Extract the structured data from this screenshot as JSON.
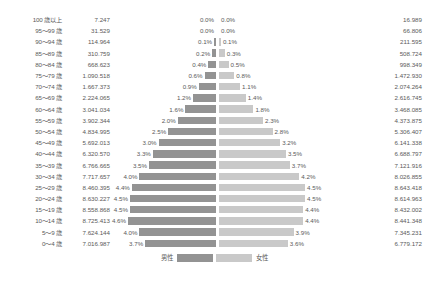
{
  "legend": {
    "male_label": "男性",
    "female_label": "女性",
    "male_color": "#939393",
    "female_color": "#c9c9c9"
  },
  "chart_data": {
    "type": "bar",
    "subtype": "population-pyramid",
    "title": "",
    "xlabel": "",
    "ylabel": "",
    "grid": false,
    "legend_position": "bottom-center",
    "max_pct": 4.6,
    "categories": [
      "100 歳以上",
      "95～99 歳",
      "90～94 歳",
      "85～89 歳",
      "80～84 歳",
      "75～79 歳",
      "70～74 歳",
      "65～69 歳",
      "60～64 歳",
      "55～59 歳",
      "50～54 歳",
      "45～49 歳",
      "40～44 歳",
      "35～39 歳",
      "30～34 歳",
      "25～29 歳",
      "20～24 歳",
      "15～19 歳",
      "10～14 歳",
      "5～9 歳",
      "0～4 歳"
    ],
    "series": [
      {
        "name": "男性",
        "color": "#939393",
        "side": "left",
        "values": [
          7247,
          31529,
          114964,
          310759,
          668623,
          1090518,
          1667373,
          2224065,
          3041034,
          3902344,
          4834995,
          5692013,
          6320570,
          6766665,
          7717657,
          8460395,
          8630227,
          8558868,
          8725413,
          7624144,
          7016987
        ],
        "value_labels": [
          "7.247",
          "31.529",
          "114.964",
          "310.759",
          "668.623",
          "1.090.518",
          "1.667.373",
          "2.224.065",
          "3.041.034",
          "3.902.344",
          "4.834.995",
          "5.692.013",
          "6.320.570",
          "6.766.665",
          "7.717.657",
          "8.460.395",
          "8.630.227",
          "8.558.868",
          "8.725.413",
          "7.624.144",
          "7.016.987"
        ],
        "percents": [
          0.0,
          0.0,
          0.1,
          0.2,
          0.4,
          0.6,
          0.9,
          1.2,
          1.6,
          2.0,
          2.5,
          3.0,
          3.3,
          3.5,
          4.0,
          4.4,
          4.5,
          4.5,
          4.6,
          4.0,
          3.7
        ],
        "percent_labels": [
          "0.0%",
          "0.0%",
          "0.1%",
          "0.2%",
          "0.4%",
          "0.6%",
          "0.9%",
          "1.2%",
          "1.6%",
          "2.0%",
          "2.5%",
          "3.0%",
          "3.3%",
          "3.5%",
          "4.0%",
          "4.4%",
          "4.5%",
          "4.5%",
          "4.6%",
          "4.0%",
          "3.7%"
        ]
      },
      {
        "name": "女性",
        "color": "#c9c9c9",
        "side": "right",
        "values": [
          16989,
          66806,
          211595,
          508724,
          998349,
          1472930,
          2074264,
          2616745,
          3468085,
          4373875,
          5306407,
          6141338,
          6688797,
          7121916,
          8026855,
          8643418,
          8614963,
          8432002,
          8441348,
          7345231,
          6779172
        ],
        "value_labels": [
          "16.989",
          "66.806",
          "211.595",
          "508.724",
          "998.349",
          "1.472.930",
          "2.074.264",
          "2.616.745",
          "3.468.085",
          "4.373.875",
          "5.306.407",
          "6.141.338",
          "6.688.797",
          "7.121.916",
          "8.026.855",
          "8.643.418",
          "8.614.963",
          "8.432.002",
          "8.441.348",
          "7.345.231",
          "6.779.172"
        ],
        "percents": [
          0.0,
          0.0,
          0.1,
          0.3,
          0.5,
          0.8,
          1.1,
          1.4,
          1.8,
          2.3,
          2.8,
          3.2,
          3.5,
          3.7,
          4.2,
          4.5,
          4.5,
          4.4,
          4.4,
          3.9,
          3.6
        ],
        "percent_labels": [
          "0.0%",
          "0.0%",
          "0.1%",
          "0.3%",
          "0.5%",
          "0.8%",
          "1.1%",
          "1.4%",
          "1.8%",
          "2.3%",
          "2.8%",
          "3.2%",
          "3.5%",
          "3.7%",
          "4.2%",
          "4.5%",
          "4.5%",
          "4.4%",
          "4.4%",
          "3.9%",
          "3.6%"
        ]
      }
    ]
  }
}
